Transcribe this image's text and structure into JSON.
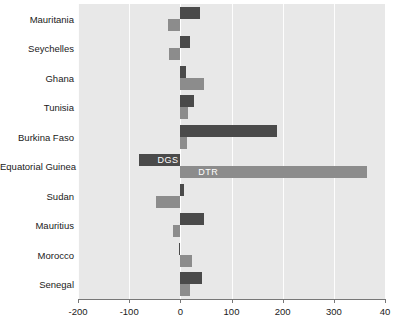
{
  "chart_data": {
    "type": "bar",
    "orientation": "horizontal",
    "title": "",
    "subtitle": "",
    "xlabel": "",
    "ylabel": "",
    "xlim": [
      -200,
      400
    ],
    "xticks": [
      -200,
      -100,
      0,
      100,
      200,
      300,
      400
    ],
    "xtick_labels": [
      "-200",
      "-100",
      "0",
      "100",
      "200",
      "300",
      "40"
    ],
    "grid": true,
    "grid_axis": "x",
    "legend": "inline-bar-labels",
    "legend_position": "on-bars",
    "categories": [
      "Mauritania",
      "Seychelles",
      "Ghana",
      "Tunisia",
      "Burkina Faso",
      "Equatorial Guinea",
      "Sudan",
      "Mauritius",
      "Morocco",
      "Senegal"
    ],
    "series": [
      {
        "name": "DGS",
        "color": "#4a4a4a",
        "values": [
          38,
          18,
          12,
          27,
          188,
          -80,
          8,
          47,
          -3,
          43
        ]
      },
      {
        "name": "DTR",
        "color": "#8c8c8c",
        "values": [
          -25,
          -22,
          47,
          15,
          14,
          365,
          -48,
          -15,
          23,
          19
        ]
      }
    ],
    "annotations": [
      {
        "text": "DGS",
        "series": "DGS",
        "category": "Equatorial Guinea"
      },
      {
        "text": "DTR",
        "series": "DTR",
        "category": "Equatorial Guinea"
      }
    ],
    "colors": {
      "plot_background": "#e8e8e8",
      "gridline": "#fdfdfd",
      "axis": "#777777",
      "text": "#1a1a1a",
      "dgs": "#4a4a4a",
      "dtr": "#8c8c8c"
    }
  }
}
